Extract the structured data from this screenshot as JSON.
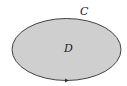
{
  "diagram": {
    "curve_label": "C",
    "region_label": "D",
    "region_fill": "#cfcfcf",
    "curve_stroke": "#444444",
    "orientation_marker": "arrow-right"
  }
}
